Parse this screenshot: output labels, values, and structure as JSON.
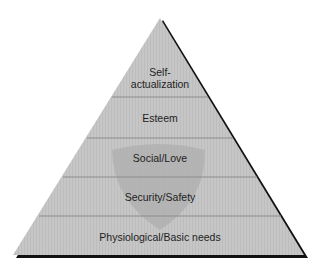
{
  "diagram": {
    "type": "pyramid",
    "levels": [
      {
        "label": "Self-\nactualization",
        "order": 5
      },
      {
        "label": "Esteem",
        "order": 4
      },
      {
        "label": "Social/Love",
        "order": 3
      },
      {
        "label": "Security/Safety",
        "order": 2
      },
      {
        "label": "Physiological/Basic needs",
        "order": 1
      }
    ],
    "colors": {
      "fill": "#c4c4c4",
      "shield": "#b3b3b3",
      "divider": "#8c8c8c",
      "shadow": "#111111",
      "text": "#1e1e1e"
    }
  }
}
